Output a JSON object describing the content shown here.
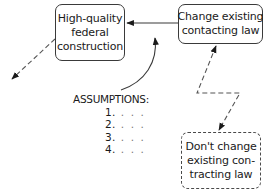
{
  "diagram": {
    "type": "decision-flow",
    "nodes": [
      {
        "id": "hq",
        "style": "solid",
        "lines": [
          "High-quality",
          "federal",
          "construction"
        ]
      },
      {
        "id": "change",
        "style": "solid",
        "lines": [
          "Change existing",
          "contacting law"
        ]
      },
      {
        "id": "dont",
        "style": "dashed",
        "lines": [
          "Don't change",
          "existing con-",
          "tracting law"
        ]
      }
    ],
    "assumptions": {
      "title": "ASSUMPTIONS:",
      "items": [
        {
          "number": "1.",
          "text": ". . ."
        },
        {
          "number": "2.",
          "text": ". . ."
        },
        {
          "number": "3.",
          "text": ". . ."
        },
        {
          "number": "4.",
          "text": ". . ."
        }
      ]
    },
    "edges": [
      {
        "from": "change",
        "to": "hq",
        "style": "solid",
        "shape": "straight"
      },
      {
        "from": "assumptions",
        "to": "change->hq edge",
        "style": "solid",
        "shape": "curved"
      },
      {
        "from": "hq",
        "to": "offscreen-lower-left",
        "style": "dashed",
        "shape": "straight"
      },
      {
        "from": "dont",
        "to": "change",
        "style": "dashed",
        "shape": "zigzag",
        "bidirectional": true
      }
    ],
    "colors": {
      "stroke": "#3a3a3a",
      "dashed_stroke": "#4a4a4a",
      "text": "#1a1a1a",
      "background": "#ffffff"
    }
  }
}
